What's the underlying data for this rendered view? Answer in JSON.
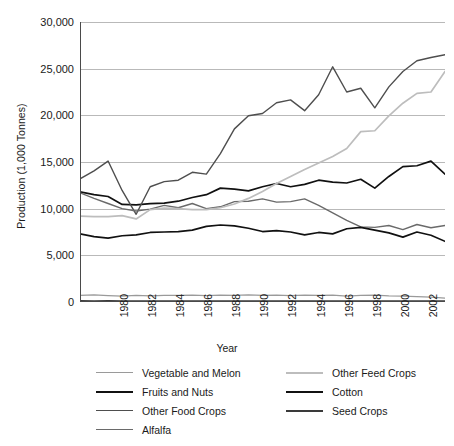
{
  "chart_data": {
    "type": "line",
    "title": "",
    "xlabel": "Year",
    "ylabel": "Production (1,000 Tonnes)",
    "xlim": [
      1980,
      2006
    ],
    "ylim": [
      0,
      30000
    ],
    "ytick_values": [
      0,
      5000,
      10000,
      15000,
      20000,
      25000,
      30000
    ],
    "ytick_labels": [
      "0",
      "5,000",
      "10,000",
      "15,000",
      "20,000",
      "25,000",
      "30,000"
    ],
    "xtick_values": [
      1980,
      1982,
      1984,
      1986,
      1988,
      1990,
      1992,
      1994,
      1996,
      1998,
      2000,
      2002,
      2004,
      2006
    ],
    "xtick_labels": [
      "1980",
      "1982",
      "1984",
      "1986",
      "1988",
      "1990",
      "1992",
      "1994",
      "1996",
      "1998",
      "2000",
      "2002",
      "2004",
      "2006"
    ],
    "grid": true,
    "legend_position": "bottom",
    "x": [
      1980,
      1981,
      1982,
      1983,
      1984,
      1985,
      1986,
      1987,
      1988,
      1989,
      1990,
      1991,
      1992,
      1993,
      1994,
      1995,
      1996,
      1997,
      1998,
      1999,
      2000,
      2001,
      2002,
      2003,
      2004,
      2005,
      2006
    ],
    "series": [
      {
        "name": "Vegetable and Melon",
        "color": "#9a9a9a",
        "width": 1.3,
        "values": [
          700,
          760,
          690,
          640,
          700,
          660,
          720,
          700,
          740,
          690,
          740,
          700,
          760,
          700,
          740,
          690,
          740,
          700,
          740,
          620,
          700,
          740,
          660,
          620,
          580,
          520,
          420
        ]
      },
      {
        "name": "Fruits and Nuts",
        "color": "#111111",
        "width": 1.7,
        "values": [
          11800,
          11500,
          11300,
          10450,
          10400,
          10550,
          10600,
          10800,
          11200,
          11500,
          12200,
          12100,
          11900,
          12350,
          12700,
          12350,
          12600,
          13050,
          12850,
          12750,
          13150,
          12200,
          13450,
          14500,
          14600,
          15100,
          13700
        ]
      },
      {
        "name": "Other Food Crops",
        "color": "#4e4e4e",
        "width": 1.4,
        "values": [
          13200,
          14050,
          15100,
          11950,
          9400,
          12350,
          12900,
          13050,
          13900,
          13700,
          15900,
          18550,
          19950,
          20200,
          21350,
          21650,
          20500,
          22200,
          25200,
          22500,
          22900,
          20800,
          23050,
          24700,
          25850,
          26200,
          26500
        ]
      },
      {
        "name": "Alfalfa",
        "color": "#6a6a6a",
        "width": 1.4,
        "values": [
          11700,
          11100,
          10550,
          10000,
          9750,
          9950,
          10350,
          10100,
          10550,
          10000,
          10200,
          10750,
          10800,
          11050,
          10700,
          10750,
          11050,
          10350,
          9550,
          8750,
          8050,
          8000,
          8200,
          7750,
          8300,
          7950,
          8200
        ]
      },
      {
        "name": "Other Feed Crops",
        "color": "#bdbdbd",
        "width": 1.7,
        "values": [
          9200,
          9150,
          9150,
          9250,
          8900,
          9900,
          10050,
          10000,
          9900,
          9900,
          10100,
          10500,
          11100,
          11850,
          12700,
          13450,
          14200,
          14900,
          15600,
          16450,
          18250,
          18350,
          19950,
          21300,
          22350,
          22500,
          24700
        ]
      },
      {
        "name": "Cotton",
        "color": "#111111",
        "width": 1.7,
        "values": [
          7300,
          7000,
          6850,
          7100,
          7200,
          7450,
          7500,
          7550,
          7700,
          8100,
          8250,
          8150,
          7900,
          7550,
          7650,
          7500,
          7200,
          7450,
          7300,
          7850,
          8000,
          7700,
          7400,
          6950,
          7500,
          7150,
          6500
        ]
      },
      {
        "name": "Seed Crops",
        "color": "#3a3a3a",
        "width": 1.6,
        "values": [
          120,
          115,
          120,
          115,
          110,
          115,
          110,
          115,
          110,
          110,
          105,
          110,
          105,
          110,
          105,
          100,
          105,
          100,
          105,
          100,
          105,
          100,
          100,
          95,
          95,
          90,
          90
        ]
      }
    ]
  },
  "legend": {
    "columns": [
      [
        {
          "label": "Vegetable and Melon",
          "color": "#9a9a9a",
          "width": 1.3
        },
        {
          "label": "Fruits and Nuts",
          "color": "#111111",
          "width": 2.2
        },
        {
          "label": "Other Food Crops",
          "color": "#4e4e4e",
          "width": 1.8
        },
        {
          "label": "Alfalfa",
          "color": "#6a6a6a",
          "width": 1.8
        }
      ],
      [
        {
          "label": "Other Feed Crops",
          "color": "#bdbdbd",
          "width": 2.0
        },
        {
          "label": "Cotton",
          "color": "#111111",
          "width": 2.2
        },
        {
          "label": "Seed Crops",
          "color": "#3a3a3a",
          "width": 2.0
        }
      ]
    ]
  }
}
